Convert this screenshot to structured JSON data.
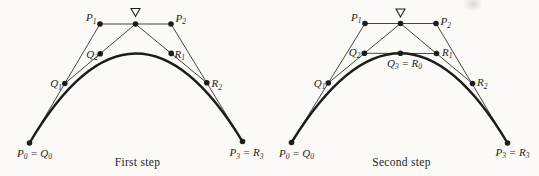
{
  "figure": {
    "background": "#fbfaf7",
    "ink": "#1c1c1c",
    "line_color": "#454545",
    "dot_radius": 2.8,
    "diagrams": [
      {
        "id": "first-step",
        "caption": "First step",
        "caption_x": 137.5,
        "points": {
          "P0": {
            "x": 29.5,
            "y": 143
          },
          "P1": {
            "x": 100,
            "y": 24
          },
          "P2": {
            "x": 171,
            "y": 24
          },
          "P3": {
            "x": 242.5,
            "y": 141.5
          },
          "Q1": {
            "x": 64.8,
            "y": 83.5
          },
          "M": {
            "x": 135.5,
            "y": 24
          },
          "Q2": {
            "x": 100.2,
            "y": 53.8
          },
          "R1": {
            "x": 171.2,
            "y": 53.4
          },
          "R2": {
            "x": 206.8,
            "y": 82.8
          }
        },
        "edges": [
          [
            "P0",
            "P1"
          ],
          [
            "P1",
            "P2"
          ],
          [
            "P2",
            "P3"
          ],
          [
            "Q1",
            "M"
          ],
          [
            "M",
            "R2"
          ]
        ],
        "curve": [
          "P0",
          "P1",
          "P2",
          "P3"
        ],
        "nabla": {
          "x": 135.5,
          "y": 8.5,
          "w": 9,
          "h": 8
        },
        "labels": [
          {
            "name": "p1",
            "x": 96.5,
            "y": 21,
            "anchor": "end",
            "parts": [
              [
                "P"
              ],
              [
                "1",
                "sub"
              ]
            ]
          },
          {
            "name": "p2",
            "x": 175.5,
            "y": 21.5,
            "anchor": "start",
            "parts": [
              [
                "P"
              ],
              [
                "2",
                "sub"
              ]
            ]
          },
          {
            "name": "q2",
            "x": 98,
            "y": 57.5,
            "anchor": "end",
            "parts": [
              [
                "Q"
              ],
              [
                "2",
                "sub"
              ]
            ]
          },
          {
            "name": "r1",
            "x": 174.5,
            "y": 57.5,
            "anchor": "start",
            "parts": [
              [
                "R"
              ],
              [
                "1",
                "sub"
              ]
            ]
          },
          {
            "name": "q1",
            "x": 62,
            "y": 87,
            "anchor": "end",
            "parts": [
              [
                "Q"
              ],
              [
                "1",
                "sub"
              ]
            ]
          },
          {
            "name": "r2",
            "x": 211.5,
            "y": 87,
            "anchor": "start",
            "parts": [
              [
                "R"
              ],
              [
                "2",
                "sub"
              ]
            ]
          },
          {
            "name": "p0q0",
            "x": 34.5,
            "y": 156.5,
            "anchor": "middle",
            "parts": [
              [
                "P"
              ],
              [
                "0",
                "sub"
              ],
              [
                " = "
              ],
              [
                "Q"
              ],
              [
                "0",
                "sub"
              ]
            ]
          },
          {
            "name": "p3r3",
            "x": 246.5,
            "y": 156,
            "anchor": "middle",
            "parts": [
              [
                "P"
              ],
              [
                "3",
                "sub"
              ],
              [
                " = "
              ],
              [
                "R"
              ],
              [
                "3",
                "sub"
              ]
            ]
          }
        ]
      },
      {
        "id": "second-step",
        "caption": "Second step",
        "caption_x": 401.5,
        "points": {
          "P0": {
            "x": 291.5,
            "y": 142.5
          },
          "P1": {
            "x": 365,
            "y": 23.5
          },
          "P2": {
            "x": 436,
            "y": 23.5
          },
          "P3": {
            "x": 507.5,
            "y": 143
          },
          "Q1": {
            "x": 328.3,
            "y": 83
          },
          "M": {
            "x": 400.5,
            "y": 23.5
          },
          "Q2": {
            "x": 364.4,
            "y": 53.3
          },
          "R1": {
            "x": 436.5,
            "y": 53.5
          },
          "R2": {
            "x": 472.5,
            "y": 83.5
          },
          "Q3": {
            "x": 400.4,
            "y": 53.3
          }
        },
        "edges": [
          [
            "P0",
            "P1"
          ],
          [
            "P1",
            "P2"
          ],
          [
            "P2",
            "P3"
          ],
          [
            "Q1",
            "M"
          ],
          [
            "M",
            "R2"
          ],
          [
            "Q2",
            "R1"
          ]
        ],
        "curve": [
          "P0",
          "P1",
          "P2",
          "P3"
        ],
        "nabla": {
          "x": 400.5,
          "y": 9,
          "w": 9,
          "h": 8
        },
        "labels": [
          {
            "name": "p1",
            "x": 361.5,
            "y": 20.5,
            "anchor": "end",
            "parts": [
              [
                "P"
              ],
              [
                "1",
                "sub"
              ]
            ]
          },
          {
            "name": "p2",
            "x": 440.5,
            "y": 25,
            "anchor": "start",
            "parts": [
              [
                "P"
              ],
              [
                "2",
                "sub"
              ]
            ]
          },
          {
            "name": "q2",
            "x": 360.5,
            "y": 55.5,
            "anchor": "end",
            "parts": [
              [
                "Q"
              ],
              [
                "2",
                "sub"
              ]
            ]
          },
          {
            "name": "r1",
            "x": 442,
            "y": 55.5,
            "anchor": "start",
            "parts": [
              [
                "R"
              ],
              [
                "1",
                "sub"
              ]
            ]
          },
          {
            "name": "q3r0",
            "x": 404.5,
            "y": 66.5,
            "anchor": "middle",
            "parts": [
              [
                "Q"
              ],
              [
                "3",
                "sub"
              ],
              [
                " = "
              ],
              [
                "R"
              ],
              [
                "0",
                "sub"
              ]
            ]
          },
          {
            "name": "q1",
            "x": 325.5,
            "y": 86.5,
            "anchor": "end",
            "parts": [
              [
                "Q"
              ],
              [
                "1",
                "sub"
              ]
            ]
          },
          {
            "name": "r2",
            "x": 477,
            "y": 86,
            "anchor": "start",
            "parts": [
              [
                "R"
              ],
              [
                "2",
                "sub"
              ]
            ]
          },
          {
            "name": "p0q0",
            "x": 296.5,
            "y": 156.5,
            "anchor": "middle",
            "parts": [
              [
                "P"
              ],
              [
                "0",
                "sub"
              ],
              [
                " = "
              ],
              [
                "Q"
              ],
              [
                "0",
                "sub"
              ]
            ]
          },
          {
            "name": "p3r3",
            "x": 512.5,
            "y": 155.5,
            "anchor": "middle",
            "parts": [
              [
                "P"
              ],
              [
                "3",
                "sub"
              ],
              [
                " = "
              ],
              [
                "R"
              ],
              [
                "3",
                "sub"
              ]
            ]
          }
        ]
      }
    ]
  }
}
